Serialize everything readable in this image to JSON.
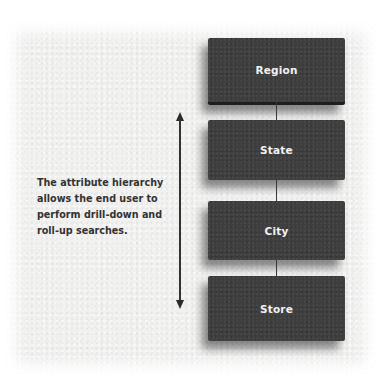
{
  "diagram": {
    "title": "Attribute hierarchy",
    "levels": [
      {
        "label": "Region"
      },
      {
        "label": "State"
      },
      {
        "label": "City"
      },
      {
        "label": "Store"
      }
    ],
    "caption_lines": [
      "The attribute hierarchy",
      "allows the end user to",
      "perform drill-down and",
      "roll-up searches."
    ],
    "arrow": {
      "type": "double-headed-vertical",
      "meaning": "drill-down / roll-up"
    },
    "colors": {
      "box_fill": "#3e3e3e",
      "box_text": "#f2f2f2",
      "background": "#f1f1f0",
      "caption_text": "#333333"
    }
  }
}
